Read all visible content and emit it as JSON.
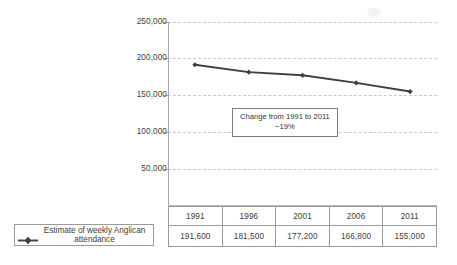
{
  "chart_data": {
    "type": "line",
    "title": "",
    "xlabel": "",
    "ylabel": "",
    "categories": [
      "1991",
      "1996",
      "2001",
      "2006",
      "2011"
    ],
    "series": [
      {
        "name": "Estimate of weekly Anglican attendance",
        "values": [
          191600,
          181500,
          177200,
          166800,
          155000
        ],
        "value_labels": [
          "191,600",
          "181,500",
          "177,200",
          "166,800",
          "155,000"
        ],
        "color": "#3f3f3f",
        "marker": "diamond"
      }
    ],
    "ylim": [
      0,
      250000
    ],
    "ytick_values": [
      250000,
      200000,
      150000,
      100000,
      50000
    ],
    "ytick_labels": [
      "250,000",
      "200,000",
      "150,000",
      "100,000",
      "50,000"
    ],
    "grid": true,
    "grid_style": "dashed-horizontal",
    "legend_position": "bottom-left",
    "annotations": [
      {
        "line1": "Change from 1991 to 2011",
        "line2": "−19%",
        "change_percent": -19,
        "from_year": "1991",
        "to_year": "2011"
      }
    ]
  },
  "legend": {
    "series_label_line1": "Estimate of weekly Anglican",
    "series_label_line2": "attendance",
    "marker_icon": "line-diamond-marker-icon"
  },
  "table": {
    "year_headers": [
      "1991",
      "1996",
      "2001",
      "2006",
      "2011"
    ],
    "value_row": [
      "191,600",
      "181,500",
      "177,200",
      "166,800",
      "155,000"
    ]
  },
  "colors": {
    "series": "#3f3f3f",
    "gridline": "#c9c9c9",
    "axis": "#a8a8a8",
    "table_border": "#9a9a9a",
    "text": "#3d3d3d",
    "background": "#ffffff"
  }
}
